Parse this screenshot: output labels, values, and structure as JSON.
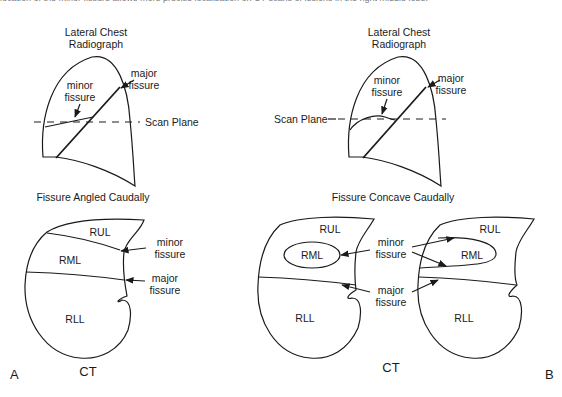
{
  "caption_clipped": "location of the minor fissure allows more precise localization on CT scans of lesions in the right middle lobe.",
  "panel_a": {
    "label": "A",
    "radiograph": {
      "title_line1": "Lateral Chest",
      "title_line2": "Radiograph",
      "minor_fissure_line1": "minor",
      "minor_fissure_line2": "fissure",
      "major_fissure_line1": "major",
      "major_fissure_line2": "fissure",
      "scan_plane": "Scan Plane"
    },
    "subtitle": "Fissure Angled Caudally",
    "ct": {
      "lobes": [
        "RUL",
        "RML",
        "RLL"
      ],
      "minor_fissure_line1": "minor",
      "minor_fissure_line2": "fissure",
      "major_fissure_line1": "major",
      "major_fissure_line2": "fissure",
      "label": "CT"
    }
  },
  "panel_b": {
    "label": "B",
    "radiograph": {
      "title_line1": "Lateral Chest",
      "title_line2": "Radiograph",
      "minor_fissure_line1": "minor",
      "minor_fissure_line2": "fissure",
      "major_fissure_line1": "major",
      "major_fissure_line2": "fissure",
      "scan_plane": "Scan Plane"
    },
    "subtitle": "Fissure Concave Caudally",
    "ct_left": {
      "lobes": [
        "RUL",
        "RML",
        "RLL"
      ]
    },
    "ct_right": {
      "lobes": [
        "RUL",
        "RML",
        "RLL"
      ]
    },
    "minor_fissure_line1": "minor",
    "minor_fissure_line2": "fissure",
    "major_fissure_line1": "major",
    "major_fissure_line2": "fissure",
    "ct_label": "CT"
  }
}
